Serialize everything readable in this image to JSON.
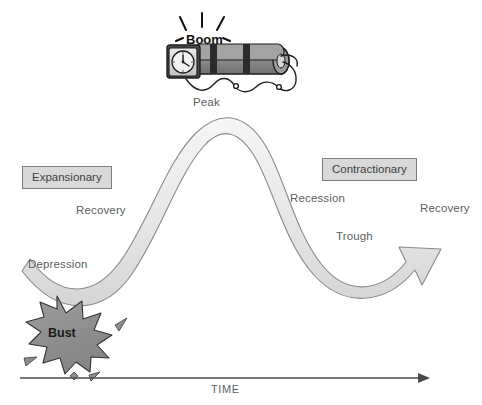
{
  "diagram": {
    "title_text": "Business Cycle",
    "axis": {
      "label": "TIME",
      "icon": "arrow-right-icon"
    },
    "phase_boxes": [
      {
        "label": "Expansionary",
        "side": "left"
      },
      {
        "label": "Contractionary",
        "side": "right"
      }
    ],
    "curve_labels": [
      {
        "label": "Peak"
      },
      {
        "label": "Recovery"
      },
      {
        "label": "Depression"
      },
      {
        "label": "Recession"
      },
      {
        "label": "Trough"
      },
      {
        "label": "Recovery"
      }
    ],
    "labels": {
      "peak": "Peak",
      "recovery_left": "Recovery",
      "depression": "Depression",
      "recession": "Recession",
      "trough": "Trough",
      "recovery_right": "Recovery"
    },
    "boom": {
      "word": "Boom",
      "icon": "dynamite-bomb-icon",
      "clock_icon": "alarm-clock-icon",
      "spark_icon": "spark-lines-icon",
      "fuse_icon": "fuse-icon"
    },
    "bust": {
      "word": "Bust",
      "icon": "explosion-starburst-icon",
      "debris_icon": "debris-shards-icon"
    },
    "colors": {
      "ribbon_fill": "#ececec",
      "ribbon_stroke": "#8a8a8a",
      "box_fill": "#d9d9d9",
      "box_stroke": "#7d7d7d",
      "text": "#5b5f63",
      "star_fill": "#8e8e8e",
      "star_stroke": "#333333",
      "bomb_body": "#8f8f8f",
      "bomb_band": "#2b2b2b",
      "axis": "#4a4a4a"
    }
  }
}
